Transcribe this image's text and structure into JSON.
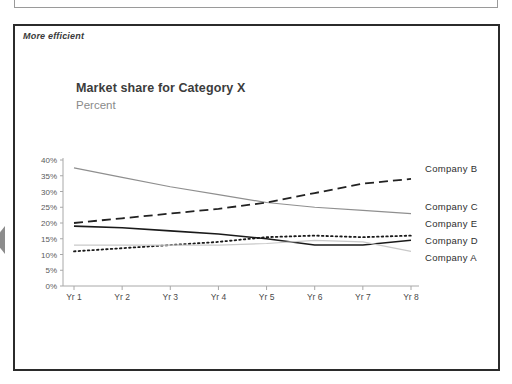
{
  "slide": {
    "annotation": "More efficient",
    "arrow_icon": "left-arrow-icon"
  },
  "chart_data": {
    "type": "line",
    "title": "Market share for Category X",
    "subtitle": "Percent",
    "xlabel": "",
    "ylabel": "Percent",
    "ylim": [
      0,
      40
    ],
    "ytick_labels": [
      "40%",
      "35%",
      "30%",
      "25%",
      "20%",
      "15%",
      "10%",
      "5%",
      "0%"
    ],
    "ytick_values": [
      40,
      35,
      30,
      25,
      20,
      15,
      10,
      5,
      0
    ],
    "categories": [
      "Yr 1",
      "Yr 2",
      "Yr 3",
      "Yr 4",
      "Yr 5",
      "Yr 6",
      "Yr 7",
      "Yr 8"
    ],
    "grid": false,
    "legend_position": "right",
    "series": [
      {
        "name": "Company B",
        "style": "solid",
        "color": "#8f8f8f",
        "width": 1.2,
        "values": [
          37.5,
          34.5,
          31.5,
          29.0,
          26.5,
          25.0,
          24.0,
          23.0
        ]
      },
      {
        "name": "Company C",
        "style": "dashed",
        "color": "#222222",
        "width": 1.8,
        "values": [
          20.0,
          21.5,
          23.0,
          24.5,
          26.5,
          29.5,
          32.5,
          34.0
        ]
      },
      {
        "name": "Company E",
        "style": "dotted",
        "color": "#1a1a1a",
        "width": 1.8,
        "values": [
          11.0,
          12.0,
          13.0,
          14.0,
          15.5,
          16.0,
          15.5,
          16.0
        ]
      },
      {
        "name": "Company D",
        "style": "solid",
        "color": "#1a1a1a",
        "width": 1.6,
        "values": [
          19.0,
          18.5,
          17.5,
          16.5,
          15.0,
          13.0,
          13.0,
          14.5
        ]
      },
      {
        "name": "Company A",
        "style": "solid",
        "color": "#c9c9c9",
        "width": 1.2,
        "values": [
          13.0,
          13.0,
          13.0,
          13.0,
          13.5,
          14.5,
          14.0,
          11.0
        ]
      }
    ]
  },
  "legend": {
    "items": [
      {
        "label": "Company B",
        "top": 163
      },
      {
        "label": "Company C",
        "top": 201
      },
      {
        "label": "Company E",
        "top": 218
      },
      {
        "label": "Company D",
        "top": 235
      },
      {
        "label": "Company A",
        "top": 252
      }
    ]
  }
}
